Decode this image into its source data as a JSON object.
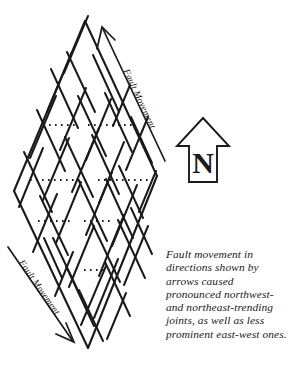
{
  "figure": {
    "name": "fault-movement-joint-diagram",
    "background_color": "#ffffff",
    "ink_color": "#1a1a1a"
  },
  "labels": {
    "fault_movement_top": "Fault Movement",
    "fault_movement_bottom": "Fault Movement",
    "north_letter": "N"
  },
  "caption": {
    "lines": [
      "Fault movement in",
      "directions shown by",
      "arrows caused",
      "pronounced northwest-",
      "and northeast-trending",
      "joints, as well as less",
      "prominent east-west ones."
    ],
    "full_text": "Fault movement in directions shown by arrows caused pronounced northwest- and northeast-trending joints, as well as less prominent east-west ones."
  },
  "compass": {
    "type": "north-arrow",
    "direction": "up",
    "letter": "N"
  },
  "diagram": {
    "shape": "rhombus",
    "vertices": {
      "top": [
        85,
        21
      ],
      "right": [
        157,
        176
      ],
      "bottom": [
        88,
        348
      ],
      "left": [
        14,
        191
      ]
    },
    "joint_sets": [
      {
        "name": "northwest-trending",
        "style": "solid",
        "prominence": "pronounced"
      },
      {
        "name": "northeast-trending",
        "style": "solid",
        "prominence": "pronounced"
      },
      {
        "name": "east-west",
        "style": "dotted",
        "prominence": "less prominent"
      }
    ],
    "east_west_rows_y": [
      125,
      180,
      221,
      270
    ]
  }
}
